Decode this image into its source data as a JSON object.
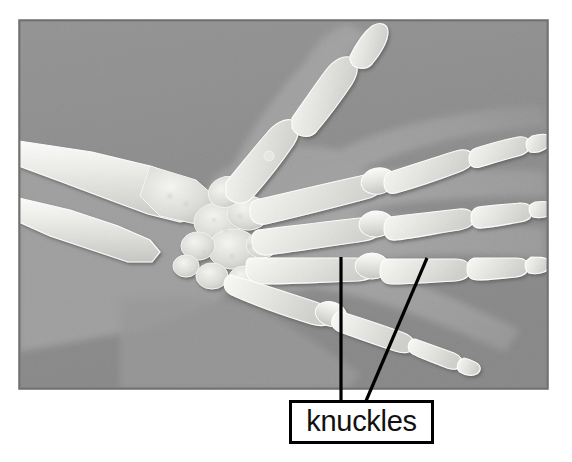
{
  "figure": {
    "kind": "annotated-xray-photograph",
    "background_color": "#ffffff",
    "canvas": {
      "width": 572,
      "height": 462
    }
  },
  "xray": {
    "name": "hand-xray-image",
    "frame": {
      "x": 19,
      "y": 20,
      "width": 529,
      "height": 369
    },
    "film_color": "#8e8e8e",
    "film_color_light": "#9c9c9c",
    "bone_color": "#f2f2f0",
    "bone_shadow_color": "#6f6f6f",
    "soft_tissue_color": "#a0a0a0",
    "border_color": "#787878",
    "anatomy_parts": [
      "radius",
      "ulna",
      "carpal bones",
      "metacarpals",
      "proximal phalanges",
      "middle phalanges",
      "distal phalanges",
      "thumb"
    ]
  },
  "annotation": {
    "label": "knuckles",
    "box": {
      "x": 289,
      "y": 400,
      "width": 145,
      "height": 44
    },
    "border_color": "#000000",
    "border_width": 3,
    "text_color": "#111111",
    "font_size_px": 29,
    "leader_lines": [
      {
        "name": "leader-line-left",
        "from": {
          "x": 341,
          "y": 257
        },
        "to": {
          "x": 341,
          "y": 400
        },
        "stroke": "#000000",
        "stroke_width": 3
      },
      {
        "name": "leader-line-right",
        "from": {
          "x": 427,
          "y": 258
        },
        "to": {
          "x": 366,
          "y": 400
        },
        "stroke": "#000000",
        "stroke_width": 3
      }
    ]
  }
}
